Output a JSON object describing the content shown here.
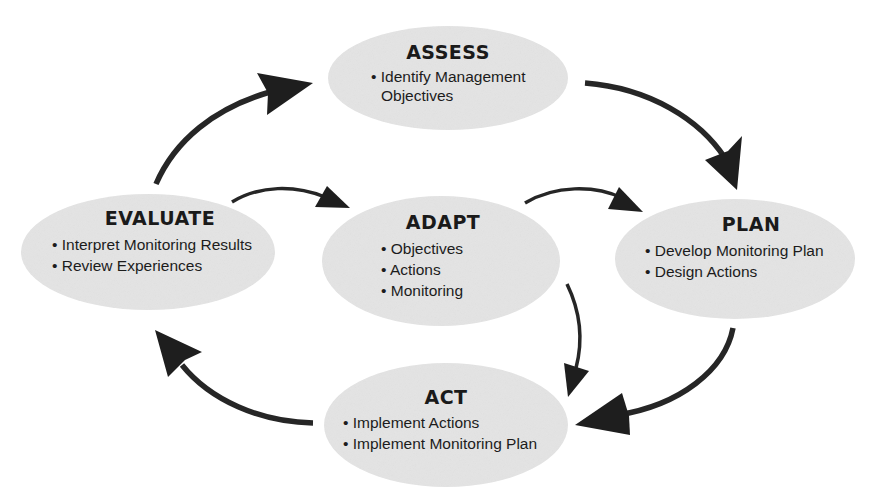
{
  "diagram": {
    "type": "adaptive-management-cycle",
    "colors": {
      "node_fill": "#e4e4e4",
      "arrow": "#222222",
      "text": "#1a1a1a",
      "background": "#ffffff"
    },
    "nodes": [
      {
        "id": "assess",
        "title": "ASSESS",
        "items": [
          "Identify Management",
          "Objectives"
        ],
        "bullets": [
          true,
          false
        ]
      },
      {
        "id": "evaluate",
        "title": "EVALUATE",
        "items": [
          "Interpret Monitoring Results",
          "Review Experiences"
        ],
        "bullets": [
          true,
          true
        ]
      },
      {
        "id": "adapt",
        "title": "ADAPT",
        "items": [
          "Objectives",
          "Actions",
          "Monitoring"
        ],
        "bullets": [
          true,
          true,
          true
        ]
      },
      {
        "id": "plan",
        "title": "PLAN",
        "items": [
          "Develop Monitoring Plan",
          "Design Actions"
        ],
        "bullets": [
          true,
          true
        ]
      },
      {
        "id": "act",
        "title": "ACT",
        "items": [
          "Implement Actions",
          "Implement Monitoring Plan"
        ],
        "bullets": [
          true,
          true
        ]
      }
    ],
    "edges": [
      {
        "from": "assess",
        "to": "plan"
      },
      {
        "from": "plan",
        "to": "act"
      },
      {
        "from": "act",
        "to": "evaluate"
      },
      {
        "from": "evaluate",
        "to": "assess"
      },
      {
        "from": "evaluate",
        "to": "adapt"
      },
      {
        "from": "adapt",
        "to": "plan"
      },
      {
        "from": "adapt",
        "to": "act"
      }
    ],
    "bullet_char": "•"
  }
}
